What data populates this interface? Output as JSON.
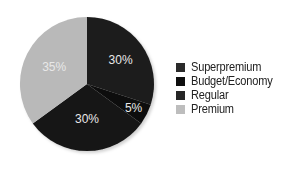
{
  "chart_data": {
    "type": "pie",
    "title": "",
    "categories": [
      "Superpremium",
      "Budget/Economy",
      "Regular",
      "Premium"
    ],
    "values": [
      30,
      5,
      30,
      35
    ],
    "labels": [
      "30%",
      "5%",
      "30%",
      "35%"
    ],
    "colors": [
      "#1c1c1c",
      "#0e0e0e",
      "#161616",
      "#b9b9b9"
    ],
    "start_angle": "12 o'clock, clockwise",
    "legend_position": "right"
  },
  "legend": {
    "items": [
      {
        "label": "Superpremium",
        "color": "#2a2a2a"
      },
      {
        "label": "Budget/Economy",
        "color": "#0e0e0e"
      },
      {
        "label": "Regular",
        "color": "#262626"
      },
      {
        "label": "Premium",
        "color": "#bdbdbd"
      }
    ]
  }
}
